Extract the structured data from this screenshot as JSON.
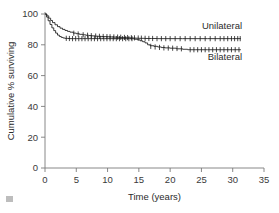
{
  "chart_data": {
    "type": "line",
    "title": "",
    "subtitle": "",
    "xlabel": "Time (years)",
    "ylabel": "Cumulative % surviving",
    "xlim": [
      0,
      35
    ],
    "ylim": [
      0,
      105
    ],
    "xticks": [
      0,
      5,
      10,
      15,
      20,
      25,
      30,
      35
    ],
    "xtick_labels": [
      "0",
      "5",
      "10",
      "15",
      "20",
      "25",
      "30",
      "35"
    ],
    "yticks": [
      0,
      20,
      40,
      60,
      80,
      100
    ],
    "ytick_labels": [
      "0",
      "20",
      "40",
      "60",
      "80",
      "100"
    ],
    "grid": false,
    "legend_position": "inline-right-of-curves",
    "annotations": [
      {
        "text": "Unilateral",
        "x": 31.5,
        "y": 90.5
      },
      {
        "text": "Bilateral",
        "x": 31.5,
        "y": 70.0
      }
    ],
    "series": [
      {
        "name": "Unilateral",
        "label": "Unilateral",
        "color": "#1a1a1a",
        "step": "post",
        "final_value": 84.0,
        "x": [
          0,
          0.3,
          0.6,
          0.9,
          1.2,
          1.6,
          2.0,
          2.4,
          2.8,
          3.2,
          3.6,
          4.0,
          4.5,
          5.0,
          5.5,
          6.0,
          6.5,
          7.0,
          7.5,
          8.0,
          8.5,
          9.0,
          9.5,
          10.0,
          10.5,
          11.0,
          11.5,
          12.0,
          12.5,
          13.0,
          13.5,
          14.0,
          14.5,
          15.0,
          16.0,
          17.0,
          18.0,
          20.0,
          22.0,
          24.0,
          26.0,
          28.0,
          30.0,
          31.3
        ],
        "y": [
          100,
          98.8,
          97.3,
          95.8,
          94.4,
          93.0,
          91.8,
          90.8,
          90.0,
          89.3,
          88.7,
          88.2,
          87.6,
          87.2,
          86.8,
          86.5,
          86.2,
          86.0,
          85.8,
          85.6,
          85.5,
          85.4,
          85.3,
          85.2,
          85.1,
          85.0,
          84.9,
          84.8,
          84.7,
          84.6,
          84.5,
          84.4,
          84.3,
          84.2,
          84.1,
          84.1,
          84.0,
          84.0,
          84.0,
          84.0,
          84.0,
          84.0,
          84.0,
          84.0
        ],
        "censor_x": [
          4.6,
          5.3,
          6.1,
          6.8,
          7.4,
          8.1,
          8.7,
          9.3,
          9.9,
          10.4,
          11.0,
          11.6,
          12.1,
          12.7,
          13.2,
          13.8,
          14.3,
          14.9,
          15.4,
          16.0,
          16.6,
          17.2,
          17.9,
          18.6,
          19.3,
          20.0,
          20.8,
          21.6,
          22.4,
          23.2,
          24.0,
          24.8,
          25.6,
          26.4,
          27.2,
          28.0,
          28.6,
          29.2,
          29.8,
          30.3,
          30.8,
          31.2
        ],
        "censor_y": [
          87.5,
          87.0,
          86.5,
          86.2,
          85.9,
          85.7,
          85.5,
          85.4,
          85.3,
          85.2,
          85.1,
          85.0,
          84.9,
          84.8,
          84.7,
          84.6,
          84.5,
          84.4,
          84.3,
          84.2,
          84.1,
          84.1,
          84.0,
          84.0,
          84.0,
          84.0,
          84.0,
          84.0,
          84.0,
          84.0,
          84.0,
          84.0,
          84.0,
          84.0,
          84.0,
          84.0,
          84.0,
          84.0,
          84.0,
          84.0,
          84.0,
          84.0
        ]
      },
      {
        "name": "Bilateral",
        "label": "Bilateral",
        "color": "#1a1a1a",
        "step": "post",
        "final_value": 76.8,
        "x": [
          0,
          0.25,
          0.5,
          0.8,
          1.1,
          1.4,
          1.7,
          2.0,
          2.3,
          2.6,
          2.9,
          3.2,
          3.6,
          4.0,
          4.5,
          5.0,
          5.5,
          6.0,
          6.5,
          7.0,
          7.5,
          8.0,
          8.5,
          9.0,
          9.5,
          10.0,
          10.5,
          11.0,
          11.5,
          12.0,
          12.5,
          13.0,
          13.5,
          14.0,
          14.4,
          14.8,
          15.2,
          15.6,
          16.0,
          16.4,
          16.8,
          17.4,
          18.0,
          18.6,
          19.2,
          20.0,
          21.0,
          22.0,
          22.8,
          24.0,
          26.0,
          28.0,
          30.0,
          31.3
        ],
        "y": [
          100,
          98.0,
          95.6,
          93.2,
          91.0,
          89.2,
          87.6,
          86.3,
          85.4,
          84.8,
          84.4,
          84.2,
          84.1,
          84.0,
          84.0,
          84.0,
          84.0,
          84.0,
          84.0,
          84.0,
          84.0,
          84.0,
          84.0,
          84.0,
          84.0,
          84.0,
          84.0,
          84.0,
          84.0,
          84.0,
          84.0,
          84.0,
          84.0,
          83.9,
          83.6,
          83.2,
          82.6,
          82.0,
          81.2,
          80.0,
          79.4,
          79.0,
          78.6,
          78.2,
          78.0,
          77.8,
          77.4,
          77.1,
          76.8,
          76.8,
          76.8,
          76.8,
          76.8,
          76.8
        ],
        "censor_x": [
          3.4,
          3.9,
          4.4,
          4.9,
          5.4,
          5.9,
          6.4,
          6.9,
          7.4,
          7.9,
          8.4,
          8.9,
          9.4,
          9.9,
          10.4,
          10.9,
          11.4,
          11.9,
          12.4,
          12.9,
          13.4,
          13.9,
          16.9,
          17.6,
          18.3,
          19.0,
          19.7,
          20.4,
          21.1,
          21.8,
          23.2,
          23.8,
          24.4,
          25.0,
          25.6,
          26.2,
          26.8,
          27.4,
          28.0,
          28.6,
          29.2,
          29.8,
          30.4,
          31.0
        ],
        "censor_y": [
          84.2,
          84.1,
          84.0,
          84.0,
          84.0,
          84.0,
          84.0,
          84.0,
          84.0,
          84.0,
          84.0,
          84.0,
          84.0,
          84.0,
          84.0,
          84.0,
          84.0,
          84.0,
          84.0,
          84.0,
          84.0,
          84.0,
          79.0,
          78.6,
          78.3,
          78.0,
          77.9,
          77.8,
          77.6,
          77.4,
          76.8,
          76.8,
          76.8,
          76.8,
          76.8,
          76.8,
          76.8,
          76.8,
          76.8,
          76.8,
          76.8,
          76.8,
          76.8,
          76.8
        ]
      }
    ]
  },
  "axes": {
    "x_title": "Time (years)",
    "y_title": "Cumulative % surviving"
  }
}
